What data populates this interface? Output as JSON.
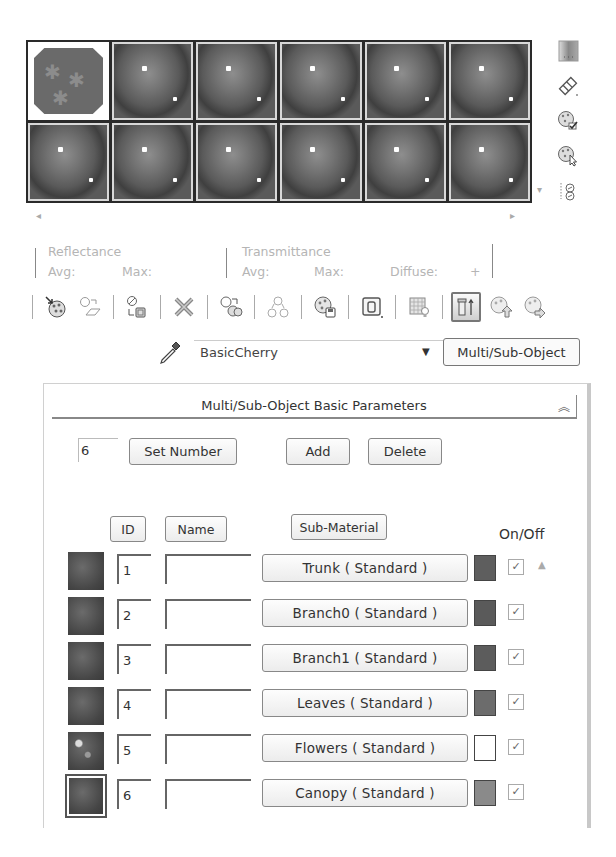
{
  "sample_slots": {
    "rows": 2,
    "cols": 6,
    "slots": [
      {
        "index": 0,
        "type": "multi-sub-object",
        "active": false
      },
      {
        "index": 1,
        "type": "sphere",
        "active": false
      },
      {
        "index": 2,
        "type": "sphere",
        "active": false
      },
      {
        "index": 3,
        "type": "sphere",
        "active": false
      },
      {
        "index": 4,
        "type": "sphere",
        "active": false
      },
      {
        "index": 5,
        "type": "sphere",
        "active": false
      },
      {
        "index": 6,
        "type": "sphere",
        "active": false
      },
      {
        "index": 7,
        "type": "sphere",
        "active": false
      },
      {
        "index": 8,
        "type": "sphere",
        "active": false
      },
      {
        "index": 9,
        "type": "sphere",
        "active": false
      },
      {
        "index": 10,
        "type": "sphere",
        "active": false
      },
      {
        "index": 11,
        "type": "sphere",
        "active": false
      }
    ]
  },
  "side_icons": [
    {
      "name": "backlight-icon"
    },
    {
      "name": "sample-uv-tiling-icon"
    },
    {
      "name": "video-color-check-icon"
    },
    {
      "name": "make-preview-icon"
    },
    {
      "name": "options-icon"
    }
  ],
  "reflectance": {
    "title": "Reflectance",
    "avg_label": "Avg:",
    "max_label": "Max:"
  },
  "transmittance": {
    "title": "Transmittance",
    "avg_label": "Avg:",
    "max_label": "Max:",
    "diffuse_label": "Diffuse:",
    "plus": "+"
  },
  "toolbar": {
    "buttons": [
      {
        "name": "get-material-icon"
      },
      {
        "name": "put-material-to-scene-icon"
      },
      {
        "name": "assign-material-to-selection-icon"
      },
      {
        "name": "reset-map-icon"
      },
      {
        "name": "make-material-copy-icon"
      },
      {
        "name": "make-unique-icon"
      },
      {
        "name": "put-to-library-icon"
      },
      {
        "name": "material-effects-channel-icon"
      },
      {
        "name": "show-map-in-viewport-icon"
      },
      {
        "name": "show-end-result-icon"
      },
      {
        "name": "go-to-parent-icon"
      },
      {
        "name": "go-forward-to-sibling-icon"
      }
    ]
  },
  "material": {
    "name": "BasicCherry",
    "type_button": "Multi/Sub-Object"
  },
  "rollout": {
    "title": "Multi/Sub-Object Basic Parameters",
    "collapse_glyph": "˄",
    "count_value": "6",
    "set_number_label": "Set Number",
    "add_label": "Add",
    "delete_label": "Delete",
    "col_id": "ID",
    "col_name": "Name",
    "col_submaterial": "Sub-Material",
    "col_onoff": "On/Off"
  },
  "submaterials": [
    {
      "id": "1",
      "name": "",
      "material": "Trunk  ( Standard )",
      "swatch": "#5e5e5e",
      "on": true
    },
    {
      "id": "2",
      "name": "",
      "material": "Branch0  ( Standard )",
      "swatch": "#5a5a5a",
      "on": true
    },
    {
      "id": "3",
      "name": "",
      "material": "Branch1  ( Standard )",
      "swatch": "#5c5c5c",
      "on": true
    },
    {
      "id": "4",
      "name": "",
      "material": "Leaves  ( Standard )",
      "swatch": "#6c6c6c",
      "on": true
    },
    {
      "id": "5",
      "name": "",
      "material": "Flowers  ( Standard )",
      "swatch": "#ffffff",
      "on": true
    },
    {
      "id": "6",
      "name": "",
      "material": "Canopy  ( Standard )",
      "swatch": "#8a8a8a",
      "on": true
    }
  ],
  "checkmark": "✓",
  "scroll": {
    "left": "◂",
    "right": "▸",
    "up": "▲",
    "down": "▾"
  }
}
